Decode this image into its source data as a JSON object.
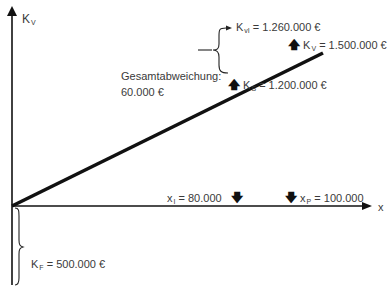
{
  "diagram": {
    "y_axis": {
      "label_main": "K",
      "label_sub": "V"
    },
    "x_axis": {
      "label": "x"
    },
    "total_deviation": {
      "label": "Gesamtabweichung:",
      "value": "60.000 €"
    },
    "annotations": {
      "kvi": {
        "main": "K",
        "sub": "vI",
        "value": "= 1.260.000 €"
      },
      "kv": {
        "main": "K",
        "sub": "V",
        "value": "= 1.500.000 €"
      },
      "ks": {
        "main": "K",
        "sub": "S",
        "value": "= 1.200.000 €"
      },
      "xi": {
        "main": "x",
        "sub": "I",
        "value": "= 80.000"
      },
      "xp": {
        "main": "x",
        "sub": "P",
        "value": "= 100.000"
      },
      "kf": {
        "main": "K",
        "sub": "F",
        "value": "= 500.000 €"
      }
    },
    "arrows": {
      "up": "🡅",
      "down": "🡇"
    },
    "colors": {
      "line": "#111111",
      "axis": "#111111",
      "text": "#3a3a3a"
    }
  }
}
